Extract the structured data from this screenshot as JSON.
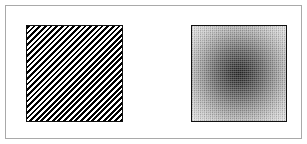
{
  "figure": {
    "width": 307,
    "height": 144,
    "background_color": "#ffffff",
    "frame": {
      "name": "outer-frame",
      "border_color": "#a9a9a9",
      "border_width": 1,
      "inset": 5
    }
  },
  "panels": [
    {
      "id": "stripes",
      "label": "Diagonal stripe texture",
      "pattern_type": "diagonal-stripes",
      "orientation": "45deg-backslash",
      "stripe_period_px": 4,
      "foreground_color": "#000000",
      "background_color": "#ffffff",
      "border_color": "#111111",
      "x": 25,
      "y": 24,
      "width": 97,
      "height": 97
    },
    {
      "id": "radial",
      "label": "Radial gradient texture",
      "pattern_type": "radial-gradient",
      "center_color": "#262626",
      "edge_color": "#dcdcdc",
      "dithered": true,
      "border_color": "#111111",
      "x": 190,
      "y": 24,
      "width": 96,
      "height": 97
    }
  ],
  "chart_data": {
    "type": "heatmap",
    "title": "",
    "subtitle": "",
    "xlabel": "",
    "ylabel": "",
    "grid": false,
    "legend": "none",
    "panels": [
      {
        "name": "Diagonal stripe texture",
        "description": "Binary black/white 45-degree diagonal stripe pattern, period 4 px, running from upper-left to lower-right",
        "value_range": [
          0,
          1
        ],
        "values_note": "alternating 0 (black) and 1 (white) bands along the anti-diagonal"
      },
      {
        "name": "Radial gradient texture",
        "description": "Dithered radial intensity field, darkest at the center and brightening monotonically toward the square's edges and corners",
        "value_range": [
          0.15,
          0.86
        ],
        "radial_profile": {
          "radius_fraction": [
            0.0,
            0.14,
            0.3,
            0.47,
            0.64,
            0.8,
            1.0
          ],
          "intensity": [
            0.15,
            0.23,
            0.36,
            0.51,
            0.65,
            0.76,
            0.86
          ]
        }
      }
    ]
  }
}
